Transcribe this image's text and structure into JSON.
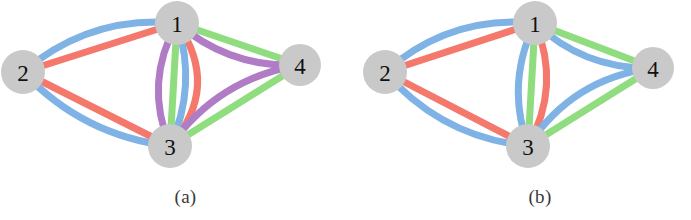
{
  "figure": {
    "background_color": "#ffffff"
  },
  "palette": {
    "blue": "#7fb2e5",
    "red": "#f4786c",
    "green": "#8fdd7f",
    "purple": "#b07cc6",
    "node_fill": "#c9c9c9",
    "node_text": "#111111",
    "caption_text": "#3a3a3a"
  },
  "panels": [
    {
      "id": "a",
      "caption": "(a)",
      "num_colors": 4,
      "nodes": [
        {
          "id": "1",
          "label": "1",
          "cx": 177,
          "cy": 23,
          "r": 22
        },
        {
          "id": "2",
          "label": "2",
          "cx": 23,
          "cy": 72,
          "r": 22
        },
        {
          "id": "3",
          "label": "3",
          "cx": 170,
          "cy": 146,
          "r": 22
        },
        {
          "id": "4",
          "label": "4",
          "cx": 300,
          "cy": 65,
          "r": 21
        }
      ],
      "edges": [
        {
          "from": "2",
          "to": "1",
          "color": "blue",
          "curve": -34,
          "width": 7
        },
        {
          "from": "2",
          "to": "1",
          "color": "red",
          "curve": 0,
          "width": 7
        },
        {
          "from": "2",
          "to": "3",
          "color": "red",
          "curve": 0,
          "width": 7
        },
        {
          "from": "2",
          "to": "3",
          "color": "blue",
          "curve": 30,
          "width": 7
        },
        {
          "from": "1",
          "to": "3",
          "color": "red",
          "curve": -48,
          "width": 7
        },
        {
          "from": "1",
          "to": "3",
          "color": "blue",
          "curve": -24,
          "width": 7
        },
        {
          "from": "1",
          "to": "3",
          "color": "green",
          "curve": 0,
          "width": 7
        },
        {
          "from": "1",
          "to": "3",
          "color": "purple",
          "curve": 30,
          "width": 7
        },
        {
          "from": "1",
          "to": "4",
          "color": "green",
          "curve": 0,
          "width": 7
        },
        {
          "from": "1",
          "to": "4",
          "color": "purple",
          "curve": 26,
          "width": 7
        },
        {
          "from": "3",
          "to": "4",
          "color": "green",
          "curve": 0,
          "width": 7
        },
        {
          "from": "3",
          "to": "4",
          "color": "purple",
          "curve": -32,
          "width": 7
        }
      ]
    },
    {
      "id": "b",
      "caption": "(b)",
      "num_colors": 3,
      "nodes": [
        {
          "id": "1",
          "label": "1",
          "cx": 190,
          "cy": 23,
          "r": 22
        },
        {
          "id": "2",
          "label": "2",
          "cx": 40,
          "cy": 72,
          "r": 22
        },
        {
          "id": "3",
          "label": "3",
          "cx": 183,
          "cy": 146,
          "r": 22
        },
        {
          "id": "4",
          "label": "4",
          "cx": 308,
          "cy": 68,
          "r": 21
        }
      ],
      "edges": [
        {
          "from": "2",
          "to": "1",
          "color": "blue",
          "curve": -34,
          "width": 7
        },
        {
          "from": "2",
          "to": "1",
          "color": "red",
          "curve": 0,
          "width": 7
        },
        {
          "from": "2",
          "to": "3",
          "color": "red",
          "curve": 0,
          "width": 7
        },
        {
          "from": "2",
          "to": "3",
          "color": "blue",
          "curve": 32,
          "width": 7
        },
        {
          "from": "1",
          "to": "3",
          "color": "red",
          "curve": -30,
          "width": 7
        },
        {
          "from": "1",
          "to": "3",
          "color": "green",
          "curve": 0,
          "width": 7
        },
        {
          "from": "1",
          "to": "3",
          "color": "blue",
          "curve": 26,
          "width": 7
        },
        {
          "from": "1",
          "to": "4",
          "color": "green",
          "curve": 0,
          "width": 7
        },
        {
          "from": "1",
          "to": "4",
          "color": "blue",
          "curve": 26,
          "width": 7
        },
        {
          "from": "3",
          "to": "4",
          "color": "green",
          "curve": 0,
          "width": 7
        },
        {
          "from": "3",
          "to": "4",
          "color": "blue",
          "curve": -34,
          "width": 7
        }
      ]
    }
  ]
}
